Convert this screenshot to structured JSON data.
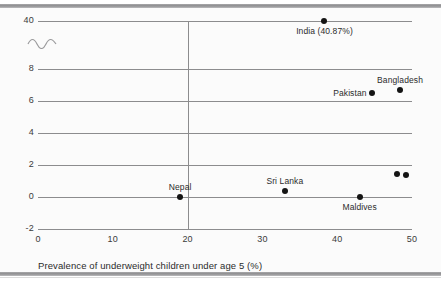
{
  "chart_data": {
    "type": "scatter",
    "title": "",
    "xlabel": "Prevalence of underweight children under age 5 (%)",
    "ylabel": "",
    "xlim": [
      0,
      50
    ],
    "ylim": [
      -2,
      40
    ],
    "grid": true,
    "legend": "none",
    "axis_break": {
      "present": true,
      "between": [
        8,
        40
      ],
      "note": "y-axis broken between 8 and 40"
    },
    "xticks": [
      "0",
      "10",
      "20",
      "30",
      "40",
      "50"
    ],
    "xtick_values": [
      0,
      10,
      20,
      30,
      40,
      50
    ],
    "yticks": [
      "-2",
      "0",
      "2",
      "4",
      "6",
      "8",
      "40"
    ],
    "ytick_values": [
      -2,
      0,
      2,
      4,
      6,
      8,
      40
    ],
    "reference_line": {
      "axis": "x",
      "value": 20
    },
    "points": [
      {
        "label": "India (40.87%)",
        "x": 38.3,
        "y": 40.0,
        "label_pos": "below"
      },
      {
        "label": "Bangladesh",
        "x": 48.4,
        "y": 6.7,
        "label_pos": "above"
      },
      {
        "label": "Pakistan",
        "x": 44.6,
        "y": 6.5,
        "label_pos": "left"
      },
      {
        "label": "Sri Lanka",
        "x": 33.0,
        "y": 0.4,
        "label_pos": "above"
      },
      {
        "label": "Nepal",
        "x": 19.0,
        "y": 0.0,
        "label_pos": "above"
      },
      {
        "label": "Maldives",
        "x": 43.0,
        "y": 0.0,
        "label_pos": "below"
      },
      {
        "label": "",
        "x": 48.0,
        "y": 1.45,
        "label_pos": "none"
      },
      {
        "label": "",
        "x": 49.2,
        "y": 1.4,
        "label_pos": "none"
      }
    ],
    "colors": {
      "marker": "#141414",
      "gridline": "#8c8c8e",
      "text": "#2b2b2b",
      "background": "#fbfbfb"
    }
  }
}
